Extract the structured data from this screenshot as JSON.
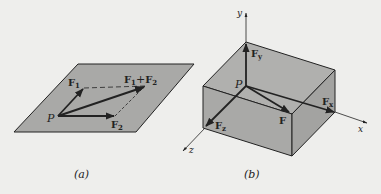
{
  "figure": {
    "colors": {
      "background": "#eeeeec",
      "plane_fill": "#a9a9a7",
      "line": "#222222"
    },
    "panel_a": {
      "caption": "(a)",
      "point_label": "P",
      "f1_label": "F",
      "f1_sub": "1",
      "f2_label": "F",
      "f2_sub": "2",
      "sum_label_f1": "F",
      "sum_label_sub1": "1",
      "sum_label_plus": "+",
      "sum_label_f2": "F",
      "sum_label_sub2": "2"
    },
    "panel_b": {
      "caption": "(b)",
      "point_label": "P",
      "axis_x": "x",
      "axis_y": "y",
      "axis_z": "z",
      "force_label": "F",
      "fx_label": "F",
      "fx_sub": "x",
      "fy_label": "F",
      "fy_sub": "y",
      "fz_label": "F",
      "fz_sub": "z"
    }
  }
}
